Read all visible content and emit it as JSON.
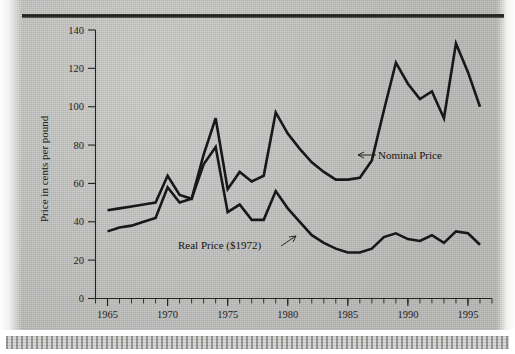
{
  "figure": {
    "background_color": "#c3c3c1",
    "ink_color": "#18181a"
  },
  "axes": {
    "y_axis_title": "Price in cents per pound",
    "y_ticks": [
      0,
      20,
      40,
      60,
      80,
      100,
      120,
      140
    ],
    "y_min": 0,
    "y_max": 140,
    "x_ticks_major": [
      1965,
      1970,
      1975,
      1980,
      1985,
      1990,
      1995
    ],
    "x_min": 1964,
    "x_max": 1997,
    "x_minor_tick_interval": 1
  },
  "annotations": [
    {
      "name": "nominal-price-label",
      "text": "Nominal Price"
    },
    {
      "name": "real-price-label",
      "text": "Real Price ($1972)"
    }
  ],
  "chart_data": {
    "type": "line",
    "title": "",
    "xlabel": "",
    "ylabel": "Price in cents per pound",
    "xlim": [
      1964,
      1997
    ],
    "ylim": [
      0,
      140
    ],
    "grid": false,
    "legend": "annotated-inline",
    "x": [
      1965,
      1966,
      1967,
      1968,
      1969,
      1970,
      1971,
      1972,
      1973,
      1974,
      1975,
      1976,
      1977,
      1978,
      1979,
      1980,
      1981,
      1982,
      1983,
      1984,
      1985,
      1986,
      1987,
      1988,
      1989,
      1990,
      1991,
      1992,
      1993,
      1994,
      1995,
      1996
    ],
    "series": [
      {
        "name": "Nominal Price",
        "values": [
          46,
          47,
          48,
          49,
          50,
          64,
          54,
          52,
          75,
          94,
          57,
          66,
          61,
          64,
          97,
          86,
          78,
          71,
          66,
          62,
          62,
          63,
          72,
          98,
          123,
          112,
          104,
          108,
          94,
          133,
          118,
          100
        ]
      },
      {
        "name": "Real Price ($1972)",
        "values": [
          35,
          37,
          38,
          40,
          42,
          58,
          50,
          52,
          70,
          79,
          45,
          49,
          41,
          41,
          56,
          47,
          40,
          33,
          29,
          26,
          24,
          24,
          26,
          32,
          34,
          31,
          30,
          33,
          29,
          35,
          34,
          28
        ]
      }
    ]
  }
}
